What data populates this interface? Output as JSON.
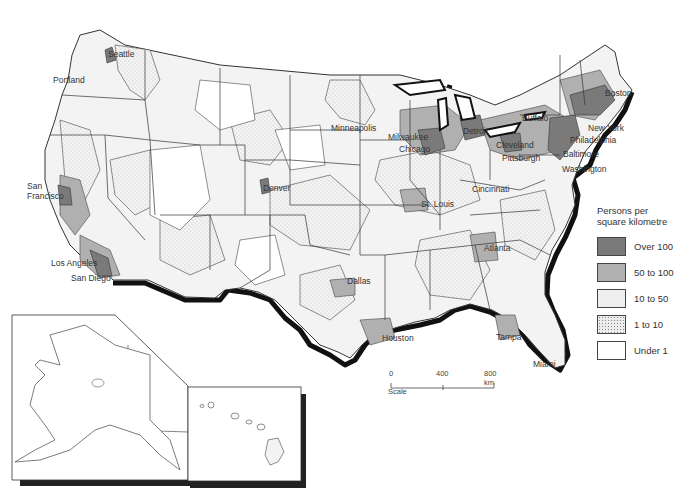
{
  "map": {
    "subject": "Population density of the United States",
    "colors": {
      "over_100": "#7a7a7a",
      "50_to_100": "#b0b0b0",
      "10_to_50": "#ececec",
      "1_to_10": "#e4e4e4",
      "under_1": "#ffffff",
      "coast_shadow": "#111111",
      "border": "#333333"
    }
  },
  "cities": [
    {
      "name": "Seattle",
      "x": 108,
      "y": 49
    },
    {
      "name": "Portland",
      "x": 53,
      "y": 75
    },
    {
      "name": "San\nFrancisco",
      "x": 27,
      "y": 181
    },
    {
      "name": "Los Angeles",
      "x": 51,
      "y": 258
    },
    {
      "name": "San Diego",
      "x": 71,
      "y": 273
    },
    {
      "name": "Denver",
      "x": 263,
      "y": 183
    },
    {
      "name": "Minneapolis",
      "x": 331,
      "y": 123
    },
    {
      "name": "Milwaukee",
      "x": 388,
      "y": 132
    },
    {
      "name": "Chicago",
      "x": 399,
      "y": 144
    },
    {
      "name": "Detroit",
      "x": 463,
      "y": 126
    },
    {
      "name": "St. Louis",
      "x": 421,
      "y": 199
    },
    {
      "name": "Cincinnati",
      "x": 472,
      "y": 184
    },
    {
      "name": "Cleveland",
      "x": 496,
      "y": 140
    },
    {
      "name": "Pittsburgh",
      "x": 502,
      "y": 153
    },
    {
      "name": "Buffalo",
      "x": 522,
      "y": 113
    },
    {
      "name": "Boston",
      "x": 605,
      "y": 88
    },
    {
      "name": "New York",
      "x": 588,
      "y": 123
    },
    {
      "name": "Philadelphia",
      "x": 570,
      "y": 135
    },
    {
      "name": "Baltimore",
      "x": 563,
      "y": 149
    },
    {
      "name": "Washington",
      "x": 562,
      "y": 164
    },
    {
      "name": "Atlanta",
      "x": 484,
      "y": 243
    },
    {
      "name": "Dallas",
      "x": 347,
      "y": 276
    },
    {
      "name": "Houston",
      "x": 382,
      "y": 333
    },
    {
      "name": "Tampa",
      "x": 496,
      "y": 332
    },
    {
      "name": "Miami",
      "x": 533,
      "y": 359
    }
  ],
  "legend": {
    "title_line1": "Persons per",
    "title_line2": "square kilometre",
    "items": [
      {
        "label": "Over 100",
        "color": "#7a7a7a"
      },
      {
        "label": "50 to 100",
        "color": "#b0b0b0"
      },
      {
        "label": "10 to 50",
        "color": "#efefef"
      },
      {
        "label": "1 to 10",
        "color": "#e2e2e2"
      },
      {
        "label": "Under 1",
        "color": "#ffffff"
      }
    ]
  },
  "scale": {
    "ticks": [
      "0",
      "400",
      "800 km"
    ],
    "title": "Scale"
  },
  "insets": [
    {
      "name": "Alaska"
    },
    {
      "name": "Hawaii"
    }
  ]
}
